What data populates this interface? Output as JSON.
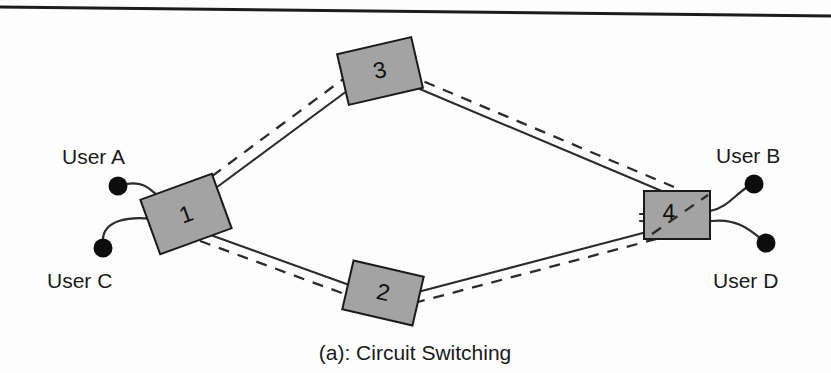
{
  "figure": {
    "caption": "(a):  Circuit Switching",
    "background_color": "#fdfdfd",
    "rule_color": "#1c1c1c",
    "node_fill": "#a3a3a3",
    "node_stroke": "#1a1a1a",
    "link_color": "#2b2b2b",
    "circuit_color": "#2b2b2b",
    "endpoint_color": "#0d0d0d",
    "width": 831,
    "height": 373
  },
  "nodes": [
    {
      "id": "node-1",
      "label": "1",
      "x": 186,
      "y": 214,
      "w": 76,
      "h": 58,
      "rotation": -20
    },
    {
      "id": "node-2",
      "label": "2",
      "x": 383,
      "y": 293,
      "w": 72,
      "h": 50,
      "rotation": 13
    },
    {
      "id": "node-3",
      "label": "3",
      "x": 380,
      "y": 71,
      "w": 76,
      "h": 52,
      "rotation": -13
    },
    {
      "id": "node-4",
      "label": "4",
      "x": 677,
      "y": 215,
      "w": 66,
      "h": 48,
      "rotation": 0
    }
  ],
  "endpoints": [
    {
      "id": "user-a",
      "label": "User A",
      "dot_x": 118,
      "dot_y": 186,
      "dot_r": 9,
      "label_x": 62,
      "label_y": 164
    },
    {
      "id": "user-c",
      "label": "User C",
      "dot_x": 103,
      "dot_y": 248,
      "dot_r": 9,
      "label_x": 47,
      "label_y": 288
    },
    {
      "id": "user-b",
      "label": "User B",
      "dot_x": 754,
      "dot_y": 184,
      "dot_r": 9,
      "label_x": 716,
      "label_y": 163
    },
    {
      "id": "user-d",
      "label": "User D",
      "dot_x": 766,
      "dot_y": 243,
      "dot_r": 9,
      "label_x": 713,
      "label_y": 288
    }
  ],
  "links": [
    {
      "id": "link-1-3",
      "from": "node-1",
      "to": "node-3",
      "style": "solid"
    },
    {
      "id": "link-3-4",
      "from": "node-3",
      "to": "node-4",
      "style": "solid"
    },
    {
      "id": "link-1-2",
      "from": "node-1",
      "to": "node-2",
      "style": "solid"
    },
    {
      "id": "link-2-4",
      "from": "node-2",
      "to": "node-4",
      "style": "solid"
    }
  ],
  "circuits": [
    {
      "id": "circuit-upper",
      "path": "node-1 - node-3 - node-4",
      "style": "dashed"
    },
    {
      "id": "circuit-lower",
      "path": "node-1 - node-2 - node-4",
      "style": "dashed"
    }
  ],
  "access_lines": [
    {
      "id": "access-user-a",
      "from": "user-a",
      "to": "node-1"
    },
    {
      "id": "access-user-c",
      "from": "user-c",
      "to": "node-1"
    },
    {
      "id": "access-user-b",
      "from": "node-4",
      "to": "user-b"
    },
    {
      "id": "access-user-d",
      "from": "node-4",
      "to": "user-d"
    }
  ]
}
